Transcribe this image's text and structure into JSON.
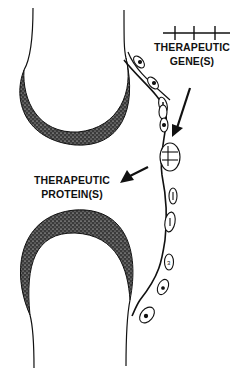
{
  "diagram": {
    "labels": {
      "gene_line1": "THERAPEUTIC",
      "gene_line2": "GENE(S)",
      "protein_line1": "THERAPEUTIC",
      "protein_line2": "PROTEIN(S)"
    },
    "colors": {
      "ink": "#111111",
      "background": "#ffffff",
      "cartilage_fill": "#2a2a2a"
    }
  }
}
